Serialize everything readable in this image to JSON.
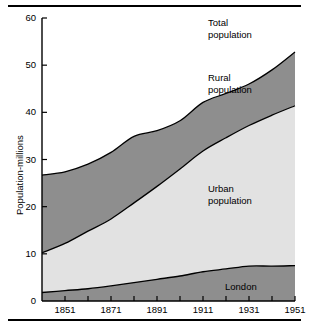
{
  "chart_data": {
    "type": "area",
    "title": "",
    "xlabel": "",
    "ylabel": "Population-millions",
    "xlim": [
      1841,
      1951
    ],
    "ylim": [
      0,
      60
    ],
    "grid": false,
    "stacked": true,
    "legend_position": "inline-annotations",
    "x": [
      1841,
      1851,
      1861,
      1871,
      1881,
      1891,
      1901,
      1911,
      1921,
      1931,
      1941,
      1951
    ],
    "y_ticks": [
      0,
      10,
      20,
      30,
      40,
      50,
      60
    ],
    "y_tick_labels": [
      "0",
      "10",
      "20",
      "30",
      "40",
      "50",
      "60"
    ],
    "x_ticks": [
      1851,
      1861,
      1871,
      1881,
      1891,
      1901,
      1911,
      1921,
      1931,
      1941,
      1951
    ],
    "x_tick_labels": [
      "1851",
      "1871",
      "1891",
      "1911",
      "1931",
      "1951"
    ],
    "x_labeled_ticks": [
      1851,
      1871,
      1891,
      1911,
      1931,
      1951
    ],
    "series": [
      {
        "name": "London",
        "color": "#8e8e8e",
        "values": [
          1.8,
          2.2,
          2.6,
          3.2,
          3.9,
          4.6,
          5.3,
          6.2,
          6.8,
          7.4,
          7.4,
          7.5
        ]
      },
      {
        "name": "Urban population",
        "color": "#e2e2e2",
        "values": [
          10.2,
          12.2,
          14.8,
          17.4,
          20.8,
          24.3,
          28.0,
          31.8,
          34.6,
          37.2,
          39.4,
          41.4
        ]
      },
      {
        "name": "Total population",
        "color": "#8e8e8e",
        "values": [
          26.7,
          27.4,
          29.0,
          31.5,
          34.9,
          36.1,
          38.2,
          42.1,
          44.0,
          46.0,
          49.0,
          52.8
        ]
      }
    ],
    "annotations": [
      {
        "text": "Total\npopulation",
        "x": 1925,
        "y": 58
      },
      {
        "text": "Rural\npopulation",
        "x": 1925,
        "y": 46
      },
      {
        "text": "Urban\npopulation",
        "x": 1925,
        "y": 21
      },
      {
        "text": "London",
        "x": 1935,
        "y": 4
      }
    ]
  },
  "axes": {
    "y_axis_label": "Population-millions",
    "y_tick_labels": [
      "60",
      "50",
      "40",
      "30",
      "20",
      "10",
      "0"
    ],
    "x_tick_labels": [
      "1851",
      "1871",
      "1891",
      "1911",
      "1931",
      "1951"
    ]
  },
  "annotations": {
    "total_line1": "Total",
    "total_line2": "population",
    "rural_line1": "Rural",
    "rural_line2": "population",
    "urban_line1": "Urban",
    "urban_line2": "population",
    "london": "London"
  },
  "colors": {
    "band_dark": "#8e8e8e",
    "band_light": "#e2e2e2",
    "stroke": "#000000",
    "background": "#ffffff"
  }
}
